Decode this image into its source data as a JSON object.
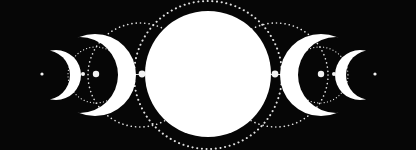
{
  "image": {
    "description": "Moon phases illustration: waxing crescents on the left, full moon in center, waning crescents on the right, connected by dots and dotted orbit arcs",
    "background_color": "#060606",
    "moon_color": "#ffffff",
    "dot_color": "#e8e8e8"
  },
  "moons": [
    {
      "phase": "small-crescent-left"
    },
    {
      "phase": "large-crescent-left"
    },
    {
      "phase": "full-moon"
    },
    {
      "phase": "large-crescent-right"
    },
    {
      "phase": "small-crescent-right"
    }
  ]
}
